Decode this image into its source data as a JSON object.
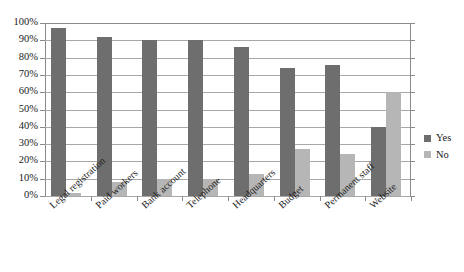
{
  "chart_data": {
    "type": "bar",
    "title": "",
    "subtitle": "",
    "xlabel": "",
    "ylabel": "",
    "ylim": [
      0,
      100
    ],
    "grid": true,
    "legend_position": "right",
    "value_suffix": "%",
    "categories": [
      "Legal registration",
      "Paid workers",
      "Bank account",
      "Telephone",
      "Headquarters",
      "Budget",
      "Permanent staff",
      "Website"
    ],
    "series": [
      {
        "name": "Yes",
        "color": "#6e6e6e",
        "values": [
          97,
          92,
          90,
          90,
          86,
          74,
          76,
          40
        ]
      },
      {
        "name": "No",
        "color": "#b6b6b6",
        "values": [
          2,
          8,
          10,
          10,
          13,
          27,
          24,
          60
        ]
      }
    ],
    "yticks": [
      {
        "value": 0,
        "label": "0%"
      },
      {
        "value": 10,
        "label": "10%"
      },
      {
        "value": 20,
        "label": "20%"
      },
      {
        "value": 30,
        "label": "30%"
      },
      {
        "value": 40,
        "label": "40%"
      },
      {
        "value": 50,
        "label": "50%"
      },
      {
        "value": 60,
        "label": "60%"
      },
      {
        "value": 70,
        "label": "70%"
      },
      {
        "value": 80,
        "label": "80%"
      },
      {
        "value": 90,
        "label": "90%"
      },
      {
        "value": 100,
        "label": "100%"
      }
    ]
  }
}
